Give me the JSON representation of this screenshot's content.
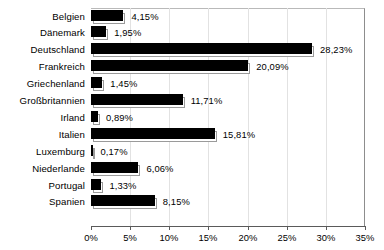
{
  "chart_data": {
    "type": "bar",
    "orientation": "horizontal",
    "title": "",
    "subtitle": "",
    "xlabel": "",
    "ylabel": "",
    "xlim": [
      0,
      35
    ],
    "x_tick_labels": [
      "0%",
      "5%",
      "10%",
      "15%",
      "20%",
      "25%",
      "30%",
      "35%"
    ],
    "x_tick_values": [
      0,
      5,
      10,
      15,
      20,
      25,
      30,
      35
    ],
    "grid": true,
    "grid_axis": "x",
    "legend": false,
    "bar_color": "#000000",
    "grid_color": "#e2e2e2",
    "axis_color": "#5a5a5a",
    "categories": [
      "Belgien",
      "Dänemark",
      "Deutschland",
      "Frankreich",
      "Griechenland",
      "Großbritannien",
      "Irland",
      "Italien",
      "Luxemburg",
      "Niederlande",
      "Portugal",
      "Spanien"
    ],
    "values": [
      4.15,
      1.95,
      28.23,
      20.09,
      1.45,
      11.71,
      0.89,
      15.81,
      0.17,
      6.06,
      1.33,
      8.15
    ],
    "value_labels": [
      "4,15%",
      "1,95%",
      "28,23%",
      "20,09%",
      "1,45%",
      "11,71%",
      "0,89%",
      "15,81%",
      "0,17%",
      "6,06%",
      "1,33%",
      "8,15%"
    ]
  }
}
